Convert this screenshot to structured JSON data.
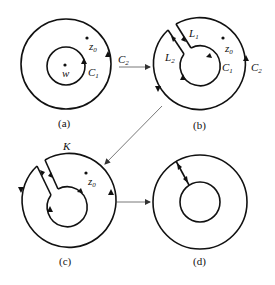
{
  "panels": {
    "a": {
      "caption": "(a)",
      "labels": {
        "point_w": "w",
        "point_z0": "z",
        "point_z0_sub": "0",
        "inner": "C",
        "inner_sub": "1"
      }
    },
    "b": {
      "caption": "(b)",
      "labels": {
        "cut1": "L",
        "cut1_sub": "1",
        "cut2": "L",
        "cut2_sub": "2",
        "point_z0": "z",
        "point_z0_sub": "0",
        "inner": "C",
        "inner_sub": "1",
        "outer": "C",
        "outer_sub": "2"
      }
    },
    "c": {
      "caption": "(c)",
      "labels": {
        "contour": "K",
        "point_z0": "z",
        "point_z0_sub": "0"
      }
    },
    "d": {
      "caption": "(d)"
    }
  },
  "connectors": {
    "a_to_b": {
      "label": "C",
      "label_sub": "2"
    },
    "b_to_c": {},
    "c_to_d": {}
  },
  "colors": {
    "stroke": "#111111",
    "connector": "#555555",
    "background": "#ffffff"
  }
}
